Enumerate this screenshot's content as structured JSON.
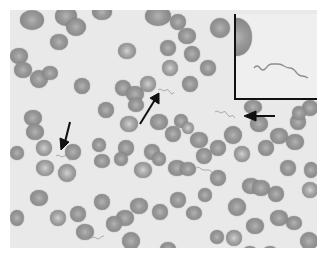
{
  "image": {
    "description": "Light micrograph of a blood smear showing red blood cells with spirochete organisms indicated by arrows, with a magnified inset of a single spirochete in the upper right",
    "arrows": [
      {
        "id": "arrow-left",
        "direction": "down"
      },
      {
        "id": "arrow-center",
        "direction": "up-right"
      },
      {
        "id": "arrow-right",
        "direction": "left"
      }
    ],
    "inset": {
      "content": "magnified spirochete",
      "position": "top-right"
    },
    "colors": {
      "background": "#e9e9e9",
      "cell": "#8a8a8a",
      "arrow": "#111111"
    }
  }
}
